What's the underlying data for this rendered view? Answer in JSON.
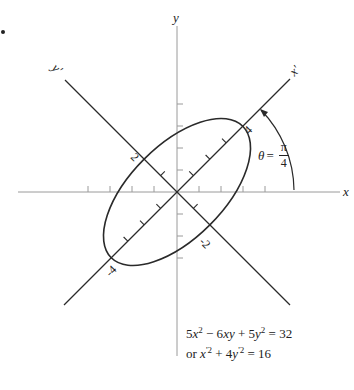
{
  "figure": {
    "type": "rotated-ellipse-diagram",
    "axes": {
      "x_label": "x",
      "y_label": "y",
      "x_prime_label": "x'",
      "y_prime_label": "y'"
    },
    "ellipse": {
      "semi_major_label": "4",
      "semi_minor_label": "2",
      "neg_semi_major_label": "-4",
      "neg_semi_minor_label": "-2"
    },
    "angle": {
      "symbol": "θ",
      "equals": "=",
      "numerator": "π",
      "denominator": "4"
    },
    "equations": {
      "line1": {
        "a": "5",
        "x": "x",
        "exp1": "2",
        "minus": " − 6",
        "xy": "xy",
        "plus": " + 5",
        "y": "y",
        "exp2": "2",
        "rhs": " = 32"
      },
      "line2": {
        "or": "or ",
        "xp": "x",
        "exp1": "'2",
        "plus": " + 4",
        "yp": "y",
        "exp2": "'2",
        "rhs": " = 16"
      }
    },
    "colors": {
      "curve": "#2a2a2a",
      "axis": "#9a9a9a",
      "text": "#222222"
    }
  }
}
